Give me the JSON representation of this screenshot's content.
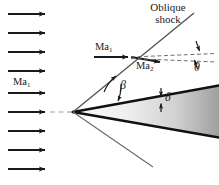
{
  "figure": {
    "background_color": "#ffffff",
    "line_color": "#1a1a1a",
    "shock_line_color": "#555555",
    "dashed_color": "#8a8a8a",
    "wedge_fill_light": "#f4f4f4",
    "wedge_fill_dark": "#9c9c9c"
  },
  "labels": {
    "oblique_line1": "Oblique",
    "oblique_line2": "shock",
    "ma1_freestream": "Ma",
    "ma1_freestream_sub": "1",
    "ma1_upper": "Ma",
    "ma1_upper_sub": "1",
    "ma2": "Ma",
    "ma2_sub": "2",
    "theta": "θ",
    "beta": "β",
    "delta": "δ"
  },
  "flow_arrows": {
    "count": 9,
    "name": "freestream-flow-arrow",
    "x_start": 8,
    "x_end": 48,
    "y_values": [
      14,
      33,
      52,
      71,
      93,
      112,
      131,
      150,
      169
    ]
  },
  "geometry": {
    "apex": {
      "x": 73,
      "y": 112
    },
    "upper_shock_end": {
      "x": 194,
      "y": 13
    },
    "lower_shock_end": {
      "x": 153,
      "y": 166
    },
    "centerline": {
      "x1": 0,
      "x2": 219,
      "y": 112
    },
    "wedge_upper_end": {
      "x": 219,
      "y": 86
    },
    "wedge_lower_end": {
      "x": 219,
      "y": 137
    },
    "shock_point": {
      "x": 131,
      "y": 57
    }
  },
  "angles": {
    "beta_description": "shock wave angle between oblique shock and centerline",
    "theta_description": "flow turning angle downstream of shock",
    "delta_description": "wedge half-angle"
  }
}
